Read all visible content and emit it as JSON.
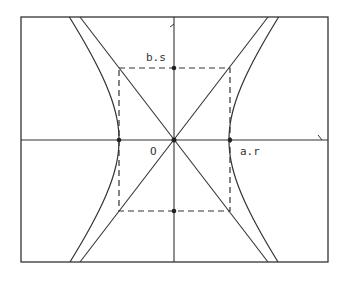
{
  "diagram": {
    "type": "hyperbola-with-asymptotes",
    "colors": {
      "stroke": "#333333",
      "background": "#ffffff"
    },
    "frame": {
      "x1": 21,
      "y1": 17,
      "x2": 328,
      "y2": 262
    },
    "center": {
      "x": 174,
      "y": 140
    },
    "semi_axes_px": {
      "a": 55,
      "b": 72
    },
    "labels": {
      "top_point": "b.s",
      "origin": "O",
      "right_vertex": "a.r"
    },
    "marked_points": [
      {
        "name": "top-co-vertex",
        "x": 174,
        "y": 68
      },
      {
        "name": "bottom-co-vertex",
        "x": 174,
        "y": 211
      },
      {
        "name": "left-vertex",
        "x": 119,
        "y": 140
      },
      {
        "name": "right-vertex",
        "x": 230,
        "y": 140
      },
      {
        "name": "origin",
        "x": 174,
        "y": 140
      }
    ],
    "dashed_box": {
      "x1": 119,
      "y1": 68,
      "x2": 230,
      "y2": 211
    }
  }
}
